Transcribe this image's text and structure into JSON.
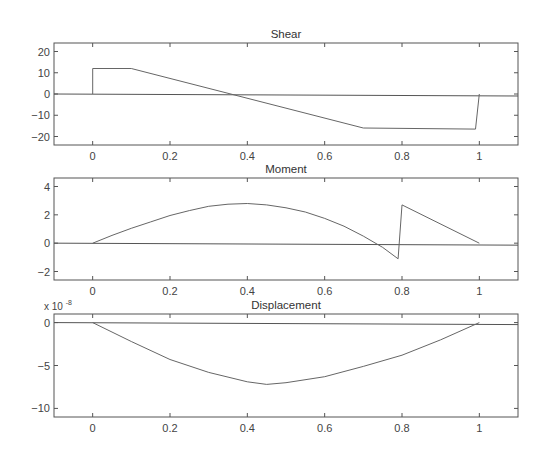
{
  "figure": {
    "width": 546,
    "height": 470
  },
  "chart_data": [
    {
      "type": "line",
      "title": "Shear",
      "xlabel": "",
      "ylabel": "",
      "xlim": [
        -0.1,
        1.1
      ],
      "ylim": [
        -24,
        24
      ],
      "xticks": [
        0,
        0.2,
        0.4,
        0.6,
        0.8,
        1
      ],
      "xtick_labels": [
        "0",
        "0.2",
        "0.4",
        "0.6",
        "0.8",
        "1"
      ],
      "yticks": [
        20,
        10,
        0,
        -10,
        -20
      ],
      "ytick_labels": [
        "20",
        "10",
        "0",
        "-10",
        "-20"
      ],
      "grid": false,
      "baseline": 0,
      "series": [
        {
          "name": "shear",
          "x": [
            0,
            0,
            0.1,
            0.7,
            0.99,
            1
          ],
          "y": [
            0,
            12,
            12,
            -16,
            -16.5,
            0
          ]
        }
      ],
      "box": {
        "left": 54,
        "top": 43,
        "right": 518,
        "bottom": 145
      }
    },
    {
      "type": "line",
      "title": "Moment",
      "xlabel": "",
      "ylabel": "",
      "xlim": [
        -0.1,
        1.1
      ],
      "ylim": [
        -2.6,
        4.6
      ],
      "xticks": [
        0,
        0.2,
        0.4,
        0.6,
        0.8,
        1
      ],
      "xtick_labels": [
        "0",
        "0.2",
        "0.4",
        "0.6",
        "0.8",
        "1"
      ],
      "yticks": [
        4,
        2,
        0,
        -2
      ],
      "ytick_labels": [
        "4",
        "2",
        "0",
        "-2"
      ],
      "grid": false,
      "baseline": 0,
      "series": [
        {
          "name": "moment",
          "x": [
            0,
            0.05,
            0.1,
            0.15,
            0.2,
            0.25,
            0.3,
            0.35,
            0.4,
            0.45,
            0.5,
            0.55,
            0.6,
            0.65,
            0.7,
            0.75,
            0.79,
            0.8,
            1
          ],
          "y": [
            0,
            0.55,
            1.05,
            1.5,
            1.95,
            2.3,
            2.6,
            2.75,
            2.8,
            2.7,
            2.5,
            2.2,
            1.75,
            1.2,
            0.5,
            -0.3,
            -1.1,
            2.7,
            0
          ]
        }
      ],
      "box": {
        "left": 54,
        "top": 178,
        "right": 518,
        "bottom": 280
      }
    },
    {
      "type": "line",
      "title": "Displacement",
      "xlabel": "",
      "ylabel": "",
      "y_exponent_label": "x 10",
      "y_exponent": "-8",
      "xlim": [
        -0.1,
        1.1
      ],
      "ylim": [
        -11,
        1
      ],
      "xticks": [
        0,
        0.2,
        0.4,
        0.6,
        0.8,
        1
      ],
      "xtick_labels": [
        "0",
        "0.2",
        "0.4",
        "0.6",
        "0.8",
        "1"
      ],
      "yticks": [
        0,
        -5,
        -10
      ],
      "ytick_labels": [
        "0",
        "-5",
        "-10"
      ],
      "grid": false,
      "baseline": 0,
      "series": [
        {
          "name": "displacement",
          "x": [
            0,
            0.1,
            0.2,
            0.3,
            0.4,
            0.45,
            0.5,
            0.6,
            0.7,
            0.8,
            0.9,
            1
          ],
          "y": [
            0,
            -2.2,
            -4.3,
            -5.8,
            -6.9,
            -7.2,
            -7.0,
            -6.3,
            -5.1,
            -3.8,
            -2.0,
            0
          ]
        }
      ],
      "box": {
        "left": 54,
        "top": 314,
        "right": 518,
        "bottom": 417
      }
    }
  ]
}
